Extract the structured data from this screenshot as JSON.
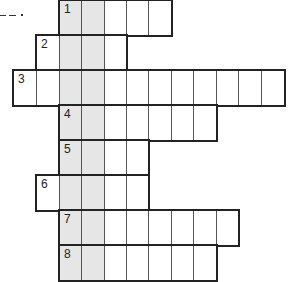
{
  "puzzle": {
    "type": "crossword-keyword",
    "shaded_columns": [
      2,
      3
    ],
    "shade_color": "#e6e6e6",
    "line_color": "#555555",
    "outline_color": "#222222",
    "column_x": [
      13,
      36,
      59,
      81,
      104,
      126,
      148,
      171,
      193,
      216,
      238,
      261,
      284
    ],
    "row_y": [
      0,
      35,
      70,
      105,
      140,
      175,
      210,
      245,
      280
    ],
    "rows": [
      {
        "number": "1",
        "start_col": 2,
        "length": 5
      },
      {
        "number": "2",
        "start_col": 1,
        "length": 4
      },
      {
        "number": "3",
        "start_col": 0,
        "length": 12
      },
      {
        "number": "4",
        "start_col": 2,
        "length": 7
      },
      {
        "number": "5",
        "start_col": 2,
        "length": 4
      },
      {
        "number": "6",
        "start_col": 1,
        "length": 5
      },
      {
        "number": "7",
        "start_col": 2,
        "length": 8
      },
      {
        "number": "8",
        "start_col": 2,
        "length": 7
      }
    ]
  },
  "decoration": {
    "dashes": [
      {
        "x": 0,
        "y": 15,
        "w": 6
      },
      {
        "x": 9,
        "y": 15,
        "w": 7
      }
    ],
    "dot": {
      "x": 21,
      "y": 14
    }
  }
}
